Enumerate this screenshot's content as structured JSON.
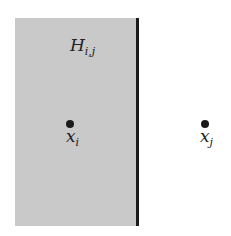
{
  "diagram": {
    "region": {
      "label_main": "H",
      "label_sub": "i,j",
      "fill": "#c9c9c9"
    },
    "boundary": {
      "color": "#1a1a1a"
    },
    "points": [
      {
        "id": "xi",
        "label_main": "x",
        "label_sub": "i"
      },
      {
        "id": "xj",
        "label_main": "x",
        "label_sub": "j"
      }
    ]
  }
}
